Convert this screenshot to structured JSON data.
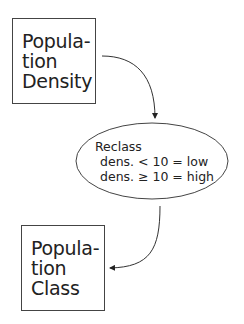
{
  "diagram": {
    "type": "flowchart",
    "nodes": [
      {
        "id": "input",
        "shape": "rectangle",
        "lines": [
          "Popula-",
          "tion",
          "Density"
        ]
      },
      {
        "id": "operation",
        "shape": "ellipse",
        "lines": [
          "Reclass",
          "dens. < 10 = low",
          "dens. ≥ 10 = high"
        ]
      },
      {
        "id": "output",
        "shape": "rectangle",
        "lines": [
          "Popula-",
          "tion",
          "Class"
        ]
      }
    ],
    "edges": [
      {
        "from": "input",
        "to": "operation"
      },
      {
        "from": "operation",
        "to": "output"
      }
    ]
  }
}
